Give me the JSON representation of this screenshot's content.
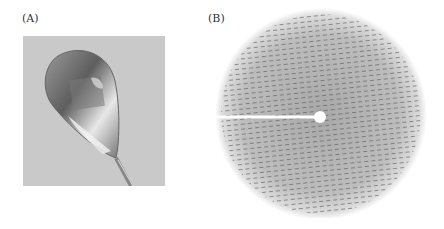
{
  "figure": {
    "panels": [
      {
        "label": "(A)",
        "content": "crystal mounted in cryo-loop photograph"
      },
      {
        "label": "(B)",
        "content": "X-ray diffraction pattern"
      }
    ],
    "colors": {
      "background": "#ffffff",
      "photo_bg": "#c9c9c9",
      "diffraction_halo": "#b8b8b8"
    }
  }
}
